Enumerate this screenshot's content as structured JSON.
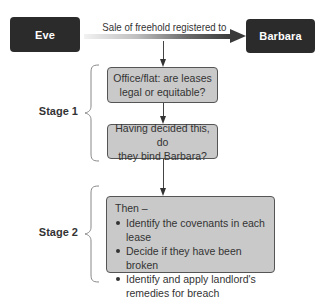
{
  "diagram": {
    "source_node": {
      "label": "Eve"
    },
    "target_node": {
      "label": "Barbara"
    },
    "transfer_arrow": {
      "label": "Sale of freehold registered to"
    },
    "stage1": {
      "label": "Stage 1",
      "box1": {
        "line1": "Office/flat: are leases",
        "line2": "legal or equitable?"
      },
      "box2": {
        "line1": "Having decided this, do",
        "line2": "they bind Barbara?"
      }
    },
    "stage2": {
      "label": "Stage 2",
      "heading": "Then –",
      "bullets": [
        "Identify the covenants in each lease",
        "Decide if they have been broken",
        "Identify and apply landlord's remedies for breach"
      ]
    },
    "colors": {
      "dark_box": "#2b2b2b",
      "gray_box": "#c9c9c9",
      "text": "#333333"
    }
  }
}
